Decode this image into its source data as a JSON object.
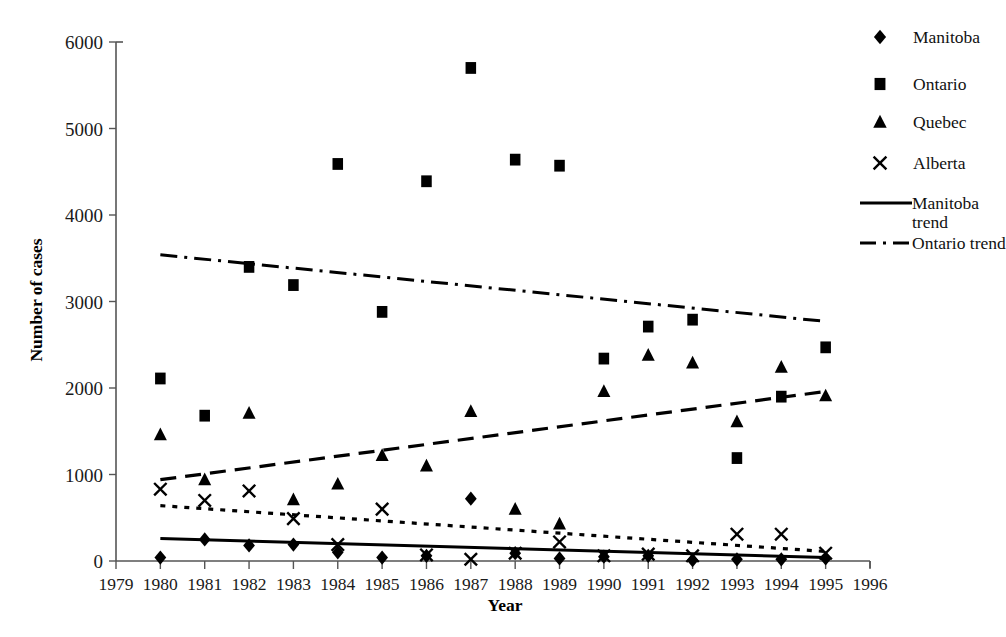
{
  "chart_data": {
    "type": "scatter",
    "title": "",
    "xlabel": "Year",
    "ylabel": "Number of cases",
    "xlim": [
      1979,
      1996
    ],
    "ylim": [
      0,
      6000
    ],
    "grid": false,
    "legend_position": "right",
    "x_ticks": [
      "1979",
      "1980",
      "1981",
      "1982",
      "1983",
      "1984",
      "1985",
      "1986",
      "1987",
      "1988",
      "1989",
      "1990",
      "1991",
      "1992",
      "1993",
      "1994",
      "1995",
      "1996"
    ],
    "y_ticks": [
      "0",
      "1000",
      "2000",
      "3000",
      "4000",
      "5000",
      "6000"
    ],
    "x": [
      1980,
      1981,
      1982,
      1983,
      1984,
      1985,
      1986,
      1987,
      1988,
      1989,
      1990,
      1991,
      1992,
      1993,
      1994,
      1995
    ],
    "series": [
      {
        "name": "Manitoba",
        "marker": "diamond",
        "values": [
          40,
          250,
          180,
          190,
          100,
          40,
          60,
          720,
          90,
          30,
          50,
          60,
          10,
          20,
          20,
          30
        ]
      },
      {
        "name": "Ontario",
        "marker": "square",
        "values": [
          2110,
          1680,
          3400,
          3190,
          4590,
          2880,
          4390,
          5700,
          4640,
          4570,
          2340,
          2710,
          2790,
          1190,
          1900,
          2470
        ]
      },
      {
        "name": "Quebec",
        "marker": "triangle",
        "values": [
          1460,
          940,
          1710,
          710,
          890,
          1220,
          1100,
          1730,
          600,
          430,
          1960,
          2380,
          2290,
          1610,
          2240,
          1910
        ]
      },
      {
        "name": "Alberta",
        "marker": "x",
        "values": [
          830,
          700,
          810,
          490,
          190,
          600,
          70,
          20,
          90,
          220,
          60,
          80,
          60,
          310,
          310,
          90
        ]
      }
    ],
    "trends": [
      {
        "name": "Manitoba trend",
        "style": "solid",
        "x_start": 1980,
        "x_end": 1995,
        "y_start": 260,
        "y_end": 40
      },
      {
        "name": "Ontario trend",
        "style": "dash-dot",
        "x_start": 1980,
        "x_end": 1995,
        "y_start": 3540,
        "y_end": 2770
      },
      {
        "name": "Quebec trend",
        "style": "long-dash",
        "x_start": 1980,
        "x_end": 1995,
        "y_start": 940,
        "y_end": 1960
      },
      {
        "name": "Alberta trend",
        "style": "dotted",
        "x_start": 1980,
        "x_end": 1995,
        "y_start": 640,
        "y_end": 110
      }
    ]
  },
  "legend": {
    "entries": [
      {
        "label": "Manitoba",
        "marker": "diamond"
      },
      {
        "label": "Ontario",
        "marker": "square"
      },
      {
        "label": "Quebec",
        "marker": "triangle"
      },
      {
        "label": "Alberta",
        "marker": "x"
      },
      {
        "label": "Manitoba",
        "marker": "solid-line"
      },
      {
        "label": "trend",
        "marker": "none"
      },
      {
        "label": "Ontario trend",
        "marker": "dash-line"
      }
    ]
  }
}
